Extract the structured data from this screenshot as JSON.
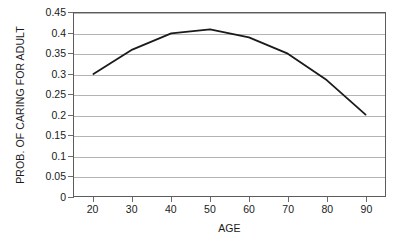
{
  "chart_data": {
    "type": "line",
    "title": "",
    "subtitle": "",
    "xlabel": "AGE",
    "ylabel": "PROB. OF CARING FOR ADULT",
    "x": [
      20,
      30,
      40,
      50,
      60,
      70,
      80,
      90
    ],
    "values": [
      0.3,
      0.36,
      0.4,
      0.41,
      0.39,
      0.35,
      0.285,
      0.2
    ],
    "series": [
      {
        "name": "",
        "values": [
          0.3,
          0.36,
          0.4,
          0.41,
          0.39,
          0.35,
          0.285,
          0.2
        ]
      }
    ],
    "xlim": [
      15,
      95
    ],
    "ylim": [
      0,
      0.45
    ],
    "x_tick_labels": [
      "20",
      "30",
      "40",
      "50",
      "60",
      "70",
      "80",
      "90"
    ],
    "x_tick_values": [
      20,
      30,
      40,
      50,
      60,
      70,
      80,
      90
    ],
    "y_tick_labels": [
      "0",
      "0.05",
      "0.1",
      "0.15",
      "0.2",
      "0.25",
      "0.3",
      "0.35",
      "0.4",
      "0.45"
    ],
    "y_tick_values": [
      0,
      0.05,
      0.1,
      0.15,
      0.2,
      0.25,
      0.3,
      0.35,
      0.4,
      0.45
    ],
    "grid": "horizontal",
    "legend": "none",
    "annotations": [],
    "colors": {
      "line": "#1a1a1a",
      "gridline": "#b4b4b4",
      "frame": "#5c5c5c",
      "tick": "#6b6b6b",
      "text": "#1a1a1a",
      "background": "#ffffff"
    },
    "line_width": 1.8
  }
}
